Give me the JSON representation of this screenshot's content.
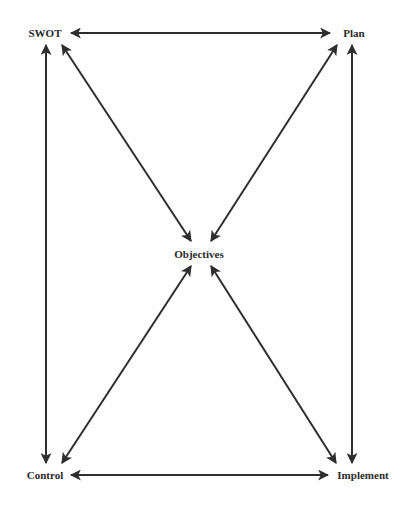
{
  "diagram": {
    "type": "cycle-with-hub",
    "nodes": [
      {
        "id": "swot",
        "label": "SWOT",
        "x": 45,
        "y": 33
      },
      {
        "id": "plan",
        "label": "Plan",
        "x": 354,
        "y": 33
      },
      {
        "id": "objectives",
        "label": "Objectives",
        "x": 199,
        "y": 254
      },
      {
        "id": "control",
        "label": "Control",
        "x": 45,
        "y": 475
      },
      {
        "id": "implement",
        "label": "Implement",
        "x": 363,
        "y": 475
      }
    ],
    "edges": [
      {
        "from": "swot",
        "to": "plan",
        "bidirectional": true
      },
      {
        "from": "swot",
        "to": "control",
        "bidirectional": true
      },
      {
        "from": "plan",
        "to": "implement",
        "bidirectional": true
      },
      {
        "from": "control",
        "to": "implement",
        "bidirectional": true
      },
      {
        "from": "swot",
        "to": "objectives",
        "bidirectional": true
      },
      {
        "from": "plan",
        "to": "objectives",
        "bidirectional": true
      },
      {
        "from": "control",
        "to": "objectives",
        "bidirectional": true
      },
      {
        "from": "implement",
        "to": "objectives",
        "bidirectional": true
      }
    ],
    "colors": {
      "line": "#2e2e2e",
      "text": "#2a2a2a",
      "background": "#fefefe"
    }
  }
}
